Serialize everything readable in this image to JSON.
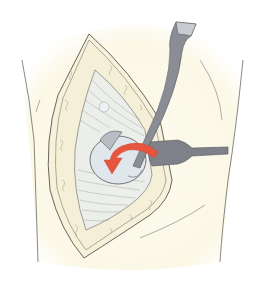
{
  "illustration": {
    "subject": "surgical-exposure-with-retractors",
    "colors": {
      "background": "#ffffff",
      "skin_tint": "#fbf8e8",
      "outline": "#5a5a5a",
      "tissue": "#eef0ec",
      "fat": "#f6f1d8",
      "bone": "#dfe7ec",
      "instrument": "#8a8d96",
      "instrument_dark": "#6c6f78",
      "arrow": "#e8553f"
    },
    "elements": [
      "body-outline",
      "incision",
      "muscle-fibers",
      "bone-head",
      "retractor-vertical",
      "retractor-horizontal",
      "rotation-arrow"
    ]
  }
}
